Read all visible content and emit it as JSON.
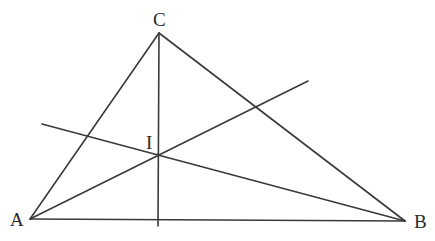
{
  "diagram": {
    "title": "",
    "stroke_color": "#3a3a3a",
    "label_color": "#2a2a2a",
    "points": [
      {
        "id": "A",
        "label": "A",
        "x": 30,
        "y": 219
      },
      {
        "id": "B",
        "label": "B",
        "x": 405,
        "y": 221
      },
      {
        "id": "C",
        "label": "C",
        "x": 159,
        "y": 33
      },
      {
        "id": "I",
        "label": "I",
        "x": 158,
        "y": 155
      }
    ],
    "labels": {
      "A": "A",
      "B": "B",
      "C": "C",
      "I": "I"
    },
    "segments": [
      {
        "name": "side-AB",
        "from": "A",
        "to": "B"
      },
      {
        "name": "side-AC",
        "from": "A",
        "to": "C"
      },
      {
        "name": "side-BC",
        "from": "B",
        "to": "C"
      },
      {
        "name": "line-from-C",
        "x1": 159,
        "y1": 33,
        "x2": 158,
        "y2": 226
      },
      {
        "name": "line-from-A",
        "x1": 30,
        "y1": 219,
        "x2": 308,
        "y2": 81
      },
      {
        "name": "line-from-B",
        "x1": 405,
        "y1": 221,
        "x2": 42,
        "y2": 124
      }
    ]
  }
}
